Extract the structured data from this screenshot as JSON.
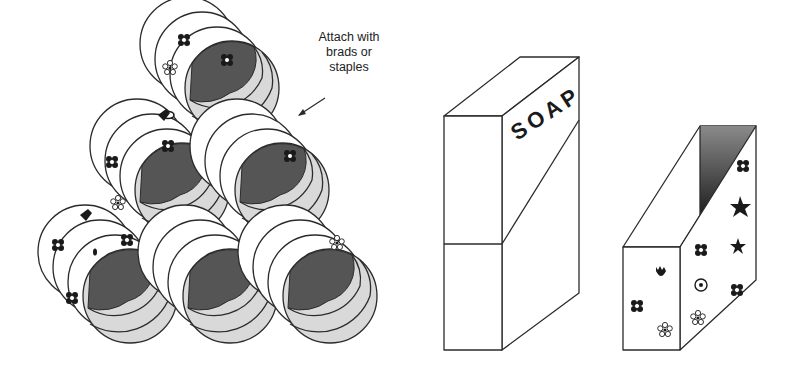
{
  "illustration": {
    "annotation": {
      "lines": [
        "Attach with",
        "brads or",
        "staples"
      ]
    },
    "soap_box": {
      "label": "SOAP"
    },
    "colors": {
      "stroke": "#2b2b2b",
      "can_face": "#d9d9d9",
      "can_inner": "#555555",
      "background": "#ffffff"
    },
    "cans": [
      {
        "id": "top",
        "cx": 232,
        "cy": 88
      },
      {
        "id": "middle-left",
        "cx": 182,
        "cy": 190
      },
      {
        "id": "middle-right",
        "cx": 282,
        "cy": 190
      },
      {
        "id": "bottom-left",
        "cx": 130,
        "cy": 296
      },
      {
        "id": "bottom-middle",
        "cx": 230,
        "cy": 296
      },
      {
        "id": "bottom-right",
        "cx": 330,
        "cy": 296
      }
    ]
  }
}
